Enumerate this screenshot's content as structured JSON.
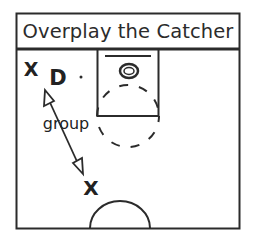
{
  "diagram": {
    "title": "Overplay the Catcher",
    "players": [
      {
        "id": "x-top",
        "label": "X",
        "role": "offense",
        "x": 31,
        "y": 69
      },
      {
        "id": "d",
        "label": "D",
        "role": "defender",
        "x": 57,
        "y": 77
      },
      {
        "id": "x-bottom",
        "label": "X",
        "role": "offense",
        "x": 90,
        "y": 188
      }
    ],
    "annotations": [
      {
        "id": "group-label",
        "text": "group"
      }
    ],
    "arrow": {
      "from": [
        45,
        92
      ],
      "to": [
        82,
        173
      ],
      "type": "double-headed"
    },
    "colors": {
      "line": "#2b2b2b",
      "background": "#ffffff"
    }
  }
}
